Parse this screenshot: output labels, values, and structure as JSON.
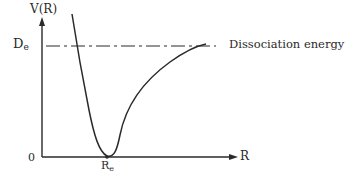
{
  "diagram": {
    "y_axis": {
      "label": "V(R)"
    },
    "x_axis": {
      "label": "R",
      "origin_label": "0"
    },
    "levels": {
      "de_label_main": "D",
      "de_label_sub": "e",
      "dissociation_label": "Dissociation energy"
    },
    "points": {
      "re_label_main": "R",
      "re_label_sub": "e"
    },
    "colors": {
      "ink": "#2a2a2a",
      "background": "#ffffff"
    }
  }
}
